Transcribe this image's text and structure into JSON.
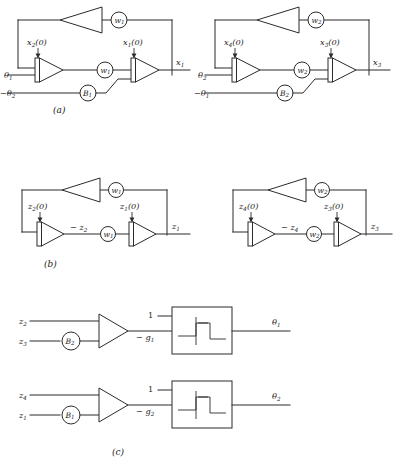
{
  "figure": {
    "background_color": "#ffffff",
    "line_color": "#2b2b2b",
    "captions": [
      {
        "id": "a",
        "text": "(a)"
      },
      {
        "id": "b",
        "text": "(b)"
      },
      {
        "id": "c",
        "text": "(c)"
      }
    ]
  },
  "panel_a": {
    "caption": "(a)",
    "left_circuit": {
      "input_labels": [
        {
          "name": "theta1",
          "text": "θ",
          "sub": "1"
        },
        {
          "name": "neg-theta2",
          "text": "−θ",
          "sub": "2"
        }
      ],
      "initial_conditions": [
        {
          "name": "x2-ic",
          "text": "x",
          "sub": "2",
          "suffix": "(0)"
        },
        {
          "name": "x1-ic",
          "text": "x",
          "sub": "1",
          "suffix": "(0)"
        }
      ],
      "gain_circles": [
        {
          "name": "w1-feedback",
          "text": "w",
          "sub": "1"
        },
        {
          "name": "w1-interstage",
          "text": "w",
          "sub": "1"
        },
        {
          "name": "B1-gain",
          "text": "B",
          "sub": "1"
        }
      ],
      "output_label": {
        "name": "x1-output",
        "text": "x",
        "sub": "1"
      }
    },
    "right_circuit": {
      "input_labels": [
        {
          "name": "theta2",
          "text": "θ",
          "sub": "2"
        },
        {
          "name": "neg-theta1",
          "text": "−θ",
          "sub": "1"
        }
      ],
      "initial_conditions": [
        {
          "name": "x4-ic",
          "text": "x",
          "sub": "4",
          "suffix": "(0)"
        },
        {
          "name": "x3-ic",
          "text": "x",
          "sub": "3",
          "suffix": "(0)"
        }
      ],
      "gain_circles": [
        {
          "name": "w2-feedback",
          "text": "w",
          "sub": "2"
        },
        {
          "name": "w2-interstage",
          "text": "w",
          "sub": "2"
        },
        {
          "name": "B2-gain",
          "text": "B",
          "sub": "2"
        }
      ],
      "output_label": {
        "name": "x3-output",
        "text": "x",
        "sub": "3"
      }
    }
  },
  "panel_b": {
    "caption": "(b)",
    "left_circuit": {
      "initial_conditions": [
        {
          "name": "z2-ic",
          "text": "z",
          "sub": "2",
          "suffix": "(0)"
        },
        {
          "name": "z1-ic",
          "text": "z",
          "sub": "1",
          "suffix": "(0)"
        }
      ],
      "signal_label": {
        "name": "neg-z2-signal",
        "text": "− z",
        "sub": "2"
      },
      "gain_circles": [
        {
          "name": "w1-feedback",
          "text": "w",
          "sub": "1"
        },
        {
          "name": "w1-interstage",
          "text": "w",
          "sub": "1"
        }
      ],
      "output_label": {
        "name": "z1-output",
        "text": "z",
        "sub": "1"
      }
    },
    "right_circuit": {
      "initial_conditions": [
        {
          "name": "z4-ic",
          "text": "z",
          "sub": "4",
          "suffix": "(0)"
        },
        {
          "name": "z3-ic",
          "text": "z",
          "sub": "3",
          "suffix": "(0)"
        }
      ],
      "signal_label": {
        "name": "neg-z4-signal",
        "text": "− z",
        "sub": "4"
      },
      "gain_circles": [
        {
          "name": "w2-feedback",
          "text": "w",
          "sub": "2"
        },
        {
          "name": "w2-interstage",
          "text": "w",
          "sub": "2"
        }
      ],
      "output_label": {
        "name": "z3-output",
        "text": "z",
        "sub": "3"
      }
    }
  },
  "panel_c": {
    "caption": "(c)",
    "top_circuit": {
      "input_labels": [
        {
          "name": "z2-input",
          "text": "z",
          "sub": "2"
        },
        {
          "name": "z3-input",
          "text": "z",
          "sub": "3"
        }
      ],
      "gain_circle": {
        "name": "B2-gain",
        "text": "B",
        "sub": "2"
      },
      "relay_inputs": [
        {
          "name": "unity-input",
          "text": "1",
          "sub": ""
        },
        {
          "name": "neg-g1-input",
          "text": "− g",
          "sub": "1"
        }
      ],
      "relay_block": {
        "name": "hysteresis-relay-block",
        "symbol": "hysteresis"
      },
      "output_label": {
        "name": "theta1-output",
        "text": "θ",
        "sub": "1"
      }
    },
    "bottom_circuit": {
      "input_labels": [
        {
          "name": "z4-input",
          "text": "z",
          "sub": "4"
        },
        {
          "name": "z1-input",
          "text": "z",
          "sub": "1"
        }
      ],
      "gain_circle": {
        "name": "B1-gain",
        "text": "B",
        "sub": "1"
      },
      "relay_inputs": [
        {
          "name": "unity-input",
          "text": "1",
          "sub": ""
        },
        {
          "name": "neg-g2-input",
          "text": "− g",
          "sub": "2"
        }
      ],
      "relay_block": {
        "name": "hysteresis-relay-block",
        "symbol": "hysteresis"
      },
      "output_label": {
        "name": "theta2-output",
        "text": "θ",
        "sub": "2"
      }
    }
  }
}
